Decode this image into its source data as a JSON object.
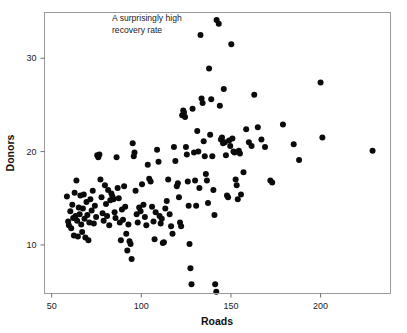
{
  "chart_data": {
    "type": "scatter",
    "title": "",
    "xlabel": "Roads",
    "ylabel": "Donors",
    "xlim": [
      46,
      239
    ],
    "ylim": [
      4.8,
      34.9
    ],
    "xticks": [
      50,
      100,
      150,
      200
    ],
    "xticklabels": [
      "50",
      "100",
      "150",
      "200"
    ],
    "yticks": [
      10,
      20,
      30
    ],
    "yticklabels": [
      "10",
      "20",
      "30"
    ],
    "grid": false,
    "legend": null,
    "marker": "circle",
    "marker_color": "#0b0b0b",
    "marker_size": 3.0,
    "annotations": [
      {
        "text_line1": "A surprisingly high",
        "text_line2": "recovery rate",
        "x": 63,
        "y": 34.2
      }
    ],
    "points": [
      {
        "x": 58.5,
        "y": 15.2
      },
      {
        "x": 59.2,
        "y": 12.5
      },
      {
        "x": 59.6,
        "y": 12.1
      },
      {
        "x": 60.4,
        "y": 13.6
      },
      {
        "x": 60.9,
        "y": 11.8
      },
      {
        "x": 61.5,
        "y": 14.3
      },
      {
        "x": 62.0,
        "y": 12.9
      },
      {
        "x": 62.4,
        "y": 11.0
      },
      {
        "x": 62.8,
        "y": 15.6
      },
      {
        "x": 63.3,
        "y": 13.1
      },
      {
        "x": 63.8,
        "y": 16.9
      },
      {
        "x": 64.2,
        "y": 12.6
      },
      {
        "x": 64.6,
        "y": 10.9
      },
      {
        "x": 65.1,
        "y": 14.0
      },
      {
        "x": 65.6,
        "y": 13.3
      },
      {
        "x": 66.0,
        "y": 15.3
      },
      {
        "x": 66.5,
        "y": 12.2
      },
      {
        "x": 67.0,
        "y": 11.4
      },
      {
        "x": 67.4,
        "y": 13.9
      },
      {
        "x": 67.9,
        "y": 15.4
      },
      {
        "x": 68.3,
        "y": 12.8
      },
      {
        "x": 68.8,
        "y": 10.8
      },
      {
        "x": 69.4,
        "y": 14.6
      },
      {
        "x": 69.9,
        "y": 13.2
      },
      {
        "x": 70.5,
        "y": 10.5
      },
      {
        "x": 71.0,
        "y": 12.4
      },
      {
        "x": 71.6,
        "y": 14.9
      },
      {
        "x": 72.3,
        "y": 13.7
      },
      {
        "x": 72.9,
        "y": 15.8
      },
      {
        "x": 73.5,
        "y": 12.3
      },
      {
        "x": 74.1,
        "y": 14.2
      },
      {
        "x": 74.8,
        "y": 13.0
      },
      {
        "x": 75.4,
        "y": 19.6
      },
      {
        "x": 76.0,
        "y": 19.4
      },
      {
        "x": 76.6,
        "y": 19.7
      },
      {
        "x": 77.2,
        "y": 17.0
      },
      {
        "x": 77.8,
        "y": 15.1
      },
      {
        "x": 78.4,
        "y": 13.4
      },
      {
        "x": 79.0,
        "y": 12.6
      },
      {
        "x": 79.7,
        "y": 16.4
      },
      {
        "x": 80.3,
        "y": 14.4
      },
      {
        "x": 80.9,
        "y": 13.1
      },
      {
        "x": 81.5,
        "y": 15.9
      },
      {
        "x": 82.1,
        "y": 12.1
      },
      {
        "x": 82.7,
        "y": 14.8
      },
      {
        "x": 83.3,
        "y": 15.5
      },
      {
        "x": 83.9,
        "y": 15.2
      },
      {
        "x": 84.5,
        "y": 14.9
      },
      {
        "x": 85.1,
        "y": 13.5
      },
      {
        "x": 85.6,
        "y": 12.9
      },
      {
        "x": 86.2,
        "y": 19.4
      },
      {
        "x": 86.8,
        "y": 16.1
      },
      {
        "x": 87.4,
        "y": 15.0
      },
      {
        "x": 88.0,
        "y": 12.4
      },
      {
        "x": 88.6,
        "y": 10.5
      },
      {
        "x": 89.2,
        "y": 13.8
      },
      {
        "x": 89.8,
        "y": 12.7
      },
      {
        "x": 90.4,
        "y": 16.3
      },
      {
        "x": 91.0,
        "y": 14.1
      },
      {
        "x": 91.6,
        "y": 11.2
      },
      {
        "x": 92.2,
        "y": 9.4
      },
      {
        "x": 92.8,
        "y": 12.2
      },
      {
        "x": 93.4,
        "y": 10.4
      },
      {
        "x": 94.0,
        "y": 10.1
      },
      {
        "x": 94.6,
        "y": 8.5
      },
      {
        "x": 95.2,
        "y": 20.9
      },
      {
        "x": 95.8,
        "y": 19.5
      },
      {
        "x": 96.2,
        "y": 19.9
      },
      {
        "x": 96.8,
        "y": 15.8
      },
      {
        "x": 97.4,
        "y": 13.3
      },
      {
        "x": 98.0,
        "y": 12.4
      },
      {
        "x": 98.8,
        "y": 14.0
      },
      {
        "x": 99.6,
        "y": 13.6
      },
      {
        "x": 100.4,
        "y": 16.5
      },
      {
        "x": 101.2,
        "y": 14.3
      },
      {
        "x": 102.0,
        "y": 13.0
      },
      {
        "x": 102.8,
        "y": 12.1
      },
      {
        "x": 103.6,
        "y": 18.6
      },
      {
        "x": 104.4,
        "y": 17.1
      },
      {
        "x": 105.2,
        "y": 16.8
      },
      {
        "x": 106.0,
        "y": 14.1
      },
      {
        "x": 106.8,
        "y": 12.5
      },
      {
        "x": 107.4,
        "y": 10.6
      },
      {
        "x": 108.0,
        "y": 13.5
      },
      {
        "x": 108.8,
        "y": 20.2
      },
      {
        "x": 109.6,
        "y": 18.9
      },
      {
        "x": 110.2,
        "y": 13.1
      },
      {
        "x": 110.8,
        "y": 12.3
      },
      {
        "x": 111.4,
        "y": 12.8
      },
      {
        "x": 112.0,
        "y": 10.2
      },
      {
        "x": 112.6,
        "y": 10.3
      },
      {
        "x": 113.4,
        "y": 13.9
      },
      {
        "x": 114.2,
        "y": 14.7
      },
      {
        "x": 115.0,
        "y": 17.0
      },
      {
        "x": 115.8,
        "y": 13.3
      },
      {
        "x": 116.6,
        "y": 12.0
      },
      {
        "x": 117.4,
        "y": 11.2
      },
      {
        "x": 118.2,
        "y": 20.5
      },
      {
        "x": 119.0,
        "y": 19.0
      },
      {
        "x": 119.8,
        "y": 16.3
      },
      {
        "x": 120.4,
        "y": 16.6
      },
      {
        "x": 121.0,
        "y": 15.1
      },
      {
        "x": 121.6,
        "y": 12.4
      },
      {
        "x": 122.2,
        "y": 12.0
      },
      {
        "x": 122.8,
        "y": 23.9
      },
      {
        "x": 123.4,
        "y": 24.4
      },
      {
        "x": 123.8,
        "y": 24.2
      },
      {
        "x": 124.4,
        "y": 23.7
      },
      {
        "x": 124.9,
        "y": 20.5
      },
      {
        "x": 125.4,
        "y": 19.7
      },
      {
        "x": 125.9,
        "y": 16.8
      },
      {
        "x": 126.4,
        "y": 14.2
      },
      {
        "x": 126.9,
        "y": 10.1
      },
      {
        "x": 127.4,
        "y": 7.5
      },
      {
        "x": 128.0,
        "y": 5.8
      },
      {
        "x": 128.6,
        "y": 24.6
      },
      {
        "x": 129.4,
        "y": 19.9
      },
      {
        "x": 130.0,
        "y": 16.9
      },
      {
        "x": 130.6,
        "y": 14.2
      },
      {
        "x": 131.2,
        "y": 22.2
      },
      {
        "x": 131.8,
        "y": 20.0
      },
      {
        "x": 132.4,
        "y": 16.1
      },
      {
        "x": 133.0,
        "y": 32.5
      },
      {
        "x": 133.6,
        "y": 25.7
      },
      {
        "x": 134.2,
        "y": 25.2
      },
      {
        "x": 134.8,
        "y": 21.1
      },
      {
        "x": 135.4,
        "y": 19.5
      },
      {
        "x": 136.0,
        "y": 17.6
      },
      {
        "x": 136.6,
        "y": 16.9
      },
      {
        "x": 137.2,
        "y": 14.5
      },
      {
        "x": 137.8,
        "y": 28.9
      },
      {
        "x": 138.4,
        "y": 21.8
      },
      {
        "x": 139.0,
        "y": 25.6
      },
      {
        "x": 139.6,
        "y": 19.5
      },
      {
        "x": 140.2,
        "y": 15.9
      },
      {
        "x": 140.8,
        "y": 13.2
      },
      {
        "x": 141.2,
        "y": 5.8
      },
      {
        "x": 141.8,
        "y": 5.0
      },
      {
        "x": 142.0,
        "y": 34.1
      },
      {
        "x": 143.2,
        "y": 33.7
      },
      {
        "x": 143.8,
        "y": 24.9
      },
      {
        "x": 144.4,
        "y": 21.3
      },
      {
        "x": 145.0,
        "y": 21.5
      },
      {
        "x": 145.6,
        "y": 20.9
      },
      {
        "x": 146.0,
        "y": 26.7
      },
      {
        "x": 146.6,
        "y": 21.0
      },
      {
        "x": 147.2,
        "y": 19.6
      },
      {
        "x": 147.8,
        "y": 15.3
      },
      {
        "x": 148.4,
        "y": 15.1
      },
      {
        "x": 149.0,
        "y": 21.2
      },
      {
        "x": 149.6,
        "y": 20.6
      },
      {
        "x": 150.2,
        "y": 31.5
      },
      {
        "x": 150.8,
        "y": 21.4
      },
      {
        "x": 151.4,
        "y": 20.0
      },
      {
        "x": 152.0,
        "y": 19.9
      },
      {
        "x": 152.6,
        "y": 17.0
      },
      {
        "x": 153.2,
        "y": 16.4
      },
      {
        "x": 153.8,
        "y": 14.9
      },
      {
        "x": 154.4,
        "y": 20.1
      },
      {
        "x": 155.0,
        "y": 19.8
      },
      {
        "x": 155.6,
        "y": 15.4
      },
      {
        "x": 157.0,
        "y": 17.8
      },
      {
        "x": 158.5,
        "y": 22.4
      },
      {
        "x": 160.0,
        "y": 21.0
      },
      {
        "x": 161.5,
        "y": 20.6
      },
      {
        "x": 163.0,
        "y": 26.1
      },
      {
        "x": 165.0,
        "y": 22.6
      },
      {
        "x": 167.0,
        "y": 21.3
      },
      {
        "x": 169.0,
        "y": 20.5
      },
      {
        "x": 172.0,
        "y": 16.9
      },
      {
        "x": 173.0,
        "y": 16.7
      },
      {
        "x": 179.0,
        "y": 22.9
      },
      {
        "x": 185.0,
        "y": 20.8
      },
      {
        "x": 188.0,
        "y": 19.1
      },
      {
        "x": 200.0,
        "y": 27.4
      },
      {
        "x": 201.0,
        "y": 21.5
      },
      {
        "x": 229.0,
        "y": 20.1
      }
    ]
  }
}
